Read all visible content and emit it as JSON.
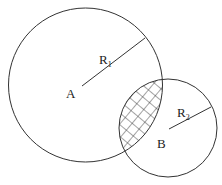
{
  "diagram": {
    "type": "intersecting-circles",
    "stroke_color": "#333333",
    "background": "#ffffff",
    "circle_a": {
      "label": "A",
      "radius_label": "R",
      "radius_subscript": "1"
    },
    "circle_b": {
      "label": "B",
      "radius_label": "R",
      "radius_subscript": "2"
    },
    "overlap": {
      "fill": "crosshatch"
    }
  }
}
